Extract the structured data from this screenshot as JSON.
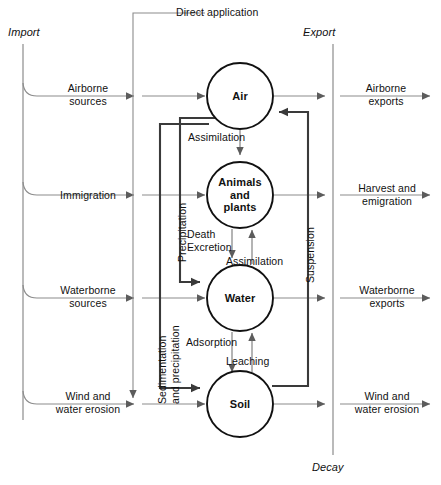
{
  "figure": {
    "type": "cycling-flow-diagram"
  },
  "boundaries": {
    "import_label": "Import",
    "export_label": "Export",
    "decay_label": "Decay"
  },
  "nodes": [
    {
      "id": "air",
      "label": "Air",
      "cx": 240,
      "cy": 96,
      "r": 33
    },
    {
      "id": "biota",
      "label": "Animals\nand\nplants",
      "cx": 240,
      "cy": 195,
      "r": 33
    },
    {
      "id": "water",
      "label": "Water",
      "cx": 240,
      "cy": 298,
      "r": 33
    },
    {
      "id": "soil",
      "label": "Soil",
      "cx": 240,
      "cy": 404,
      "r": 33
    }
  ],
  "imports": [
    {
      "id": "airborne-sources",
      "label": "Airborne\nsources",
      "y": 96
    },
    {
      "id": "immigration",
      "label": "Immigration",
      "y": 195
    },
    {
      "id": "waterborne-sources",
      "label": "Waterborne\nsources",
      "y": 298
    },
    {
      "id": "wind-water-erosion",
      "label": "Wind and\nwater erosion",
      "y": 404
    }
  ],
  "exports": [
    {
      "id": "airborne-exports",
      "label": "Airborne\nexports",
      "y": 96
    },
    {
      "id": "harvest-emigration",
      "label": "Harvest and\nemigration",
      "y": 195
    },
    {
      "id": "waterborne-exports",
      "label": "Waterborne\nexports",
      "y": 298
    },
    {
      "id": "wind-water-erosion-out",
      "label": "Wind and\nwater erosion",
      "y": 404
    }
  ],
  "internal_flows": [
    {
      "id": "direct-application",
      "label": "Direct application",
      "orientation": "horizontal"
    },
    {
      "id": "assimilation-air-biota",
      "label": "Assimilation",
      "orientation": "horizontal"
    },
    {
      "id": "death-excretion",
      "label": "Death\nExcretion",
      "orientation": "horizontal"
    },
    {
      "id": "assimilation-water-biota",
      "label": "Assimilation",
      "orientation": "horizontal"
    },
    {
      "id": "adsorption",
      "label": "Adsorption",
      "orientation": "horizontal"
    },
    {
      "id": "leaching",
      "label": "Leaching",
      "orientation": "horizontal"
    },
    {
      "id": "precipitation",
      "label": "Precipitation",
      "orientation": "vertical"
    },
    {
      "id": "sedimentation-and-precipitation",
      "label": "Sedimentation\nand precipitation",
      "orientation": "vertical"
    },
    {
      "id": "suspension",
      "label": "Suspension",
      "orientation": "vertical"
    }
  ],
  "colors": {
    "thin_line": "#8c8c8c",
    "thick_line": "#3a3a3a",
    "circle_stroke": "#111111",
    "text": "#111111"
  }
}
